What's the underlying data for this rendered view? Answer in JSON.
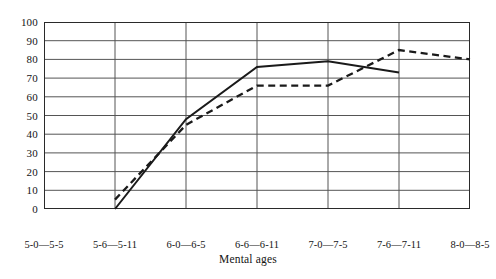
{
  "chart_data": {
    "type": "line",
    "title": "",
    "subtitle": "",
    "xlabel": "Mental ages",
    "ylabel": "",
    "ylim": [
      0,
      100
    ],
    "ytick_step": 10,
    "yticks": [
      100,
      90,
      80,
      70,
      60,
      50,
      40,
      30,
      20,
      10,
      0
    ],
    "grid": true,
    "legend": "none",
    "categories": [
      "5-0—5-5",
      "5-6—5-11",
      "6-0—6-5",
      "6-6—6-11",
      "7-0—7-5",
      "7-6—7-11",
      "8-0—8-5"
    ],
    "series": [
      {
        "name": "solid",
        "style": "solid",
        "color": "#1a1a1a",
        "values": [
          null,
          0,
          48,
          76,
          79,
          73,
          null
        ]
      },
      {
        "name": "dashed",
        "style": "dashed",
        "color": "#1a1a1a",
        "values": [
          null,
          5,
          45,
          66,
          66,
          85,
          80
        ]
      }
    ]
  },
  "axes": {
    "frame_color": "#2a2a2a",
    "grid_color": "#555555"
  }
}
